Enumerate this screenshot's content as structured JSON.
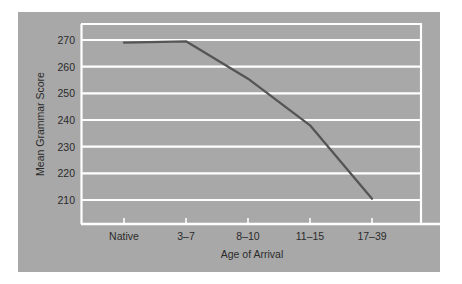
{
  "figure": {
    "background_color": "#ffffff",
    "panel_color": "#a8a8a8",
    "gridline_color": "#ffffff",
    "axis_color": "#ffffff",
    "series_color": "#555555",
    "text_color": "#2b2b2b"
  },
  "chart_data": {
    "type": "line",
    "title": "",
    "xlabel": "Age of Arrival",
    "ylabel": "Mean Grammar Score",
    "categories": [
      "Native",
      "3–7",
      "8–10",
      "11–15",
      "17–39"
    ],
    "values": [
      269,
      269.5,
      255.5,
      238,
      210.5
    ],
    "series": [
      {
        "name": "Mean Grammar Score",
        "values": [
          269,
          269.5,
          255.5,
          238,
          210.5
        ]
      }
    ],
    "ylim": [
      203,
      276
    ],
    "yticks": [
      210,
      220,
      230,
      240,
      250,
      260,
      270
    ],
    "ytick_labels": [
      "210",
      "220",
      "230",
      "240",
      "250",
      "260",
      "270"
    ],
    "xtick_labels": [
      "Native",
      "3–7",
      "8–10",
      "11–15",
      "17–39"
    ],
    "grid": true,
    "grid_axis": "y",
    "legend": false,
    "legend_position": "none",
    "markers": false,
    "annotations": []
  }
}
